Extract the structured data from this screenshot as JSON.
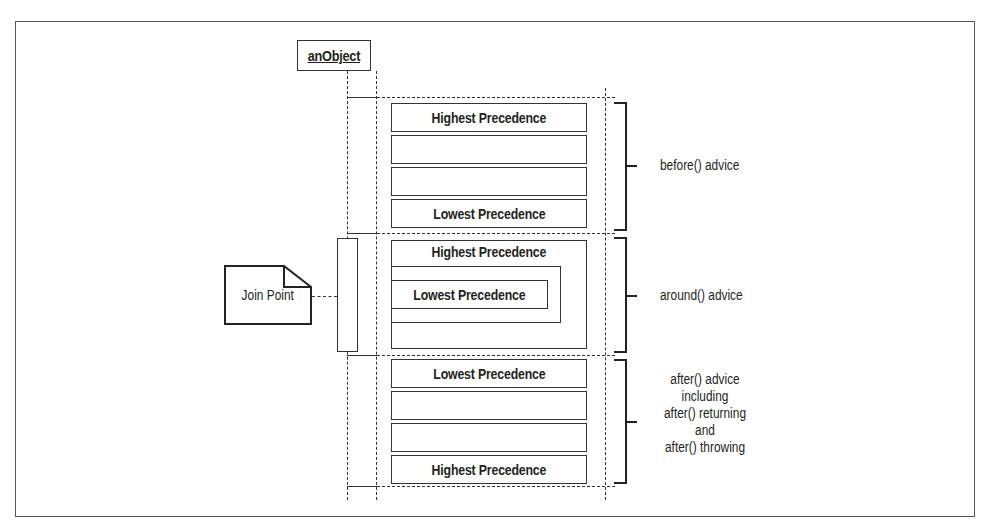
{
  "diagram": {
    "object": {
      "label": "anObject"
    },
    "join_point": {
      "label": "Join Point"
    },
    "before_section": {
      "boxes": [
        "Highest Precedence",
        "",
        "",
        "Lowest Precedence"
      ],
      "bracket_label": "before() advice"
    },
    "around_section": {
      "outer_label": "Highest Precedence",
      "inner_label": "Lowest Precedence",
      "bracket_label": "around() advice"
    },
    "after_section": {
      "boxes": [
        "Lowest Precedence",
        "",
        "",
        "Highest Precedence"
      ],
      "bracket_label_lines": [
        "after() advice",
        "including",
        "after() returning",
        "and",
        "after() throwing"
      ]
    },
    "colors": {
      "line": "#333333",
      "background": "#ffffff"
    }
  }
}
